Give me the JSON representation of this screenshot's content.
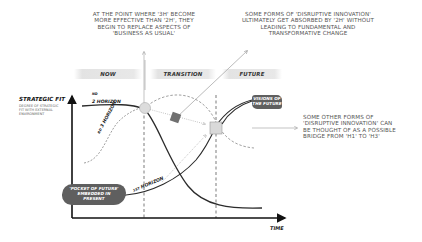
{
  "annotations": {
    "top_left": "AT THE POINT WHERE '3H' BECOME MORE EFFECTIVE THAN '2H', THEY BEGIN TO REPLACE ASPECTS OF 'BUSINESS AS USUAL'",
    "top_left_lines": [
      "AT THE POINT WHERE '3H' BECOME",
      "MORE EFFECTIVE THAN '2H', THEY",
      "BEGIN TO REPLACE ASPECTS OF",
      "'BUSINESS AS USUAL'"
    ],
    "top_right_lines": [
      "SOME FORMS OF 'DISRUPTIVE INNOVATION'",
      "ULTIMATELY GET ABSORBED BY '2H' WITHOUT",
      "LEADING TO FUNDAMENTAL AND",
      "TRANSFORMATIVE CHANGE"
    ],
    "right_lines": [
      "SOME OTHER FORMS OF",
      "'DISRUPTIVE INNOVATION' CAN",
      "BE THOUGHT OF AS A POSSIBLE",
      "BRIDGE FROM 'H1' TO 'H3'"
    ]
  },
  "phases": [
    "NOW",
    "TRANSITION",
    "FUTURE"
  ],
  "axes": {
    "y_label": "STRATEGIC FIT",
    "y_sub_lines": [
      "DEGREE OF STRATEGIC",
      "FIT WITH EXTERNAL",
      "ENVIRONMENT"
    ],
    "x_label": "TIME"
  },
  "horizons": {
    "h1": {
      "sup": "1ST",
      "label": "HORIZON"
    },
    "h2": {
      "sup": "ND",
      "label": "2 HORIZON"
    },
    "h3": {
      "sup": "RD",
      "label": "3 HORIZON"
    }
  },
  "callouts": {
    "pocket": [
      "'POCKET OF FUTURE'",
      "EMBEDDED IN",
      "PRESENT"
    ],
    "visions": [
      "VISIONS OF",
      "THE FUTURE"
    ]
  },
  "colors": {
    "curve_dark": "#2b2b2b",
    "dashed": "#777777",
    "node_fill": "#d9d9d9",
    "blob_fill": "#5f5f5f",
    "square_dark": "#707070"
  }
}
